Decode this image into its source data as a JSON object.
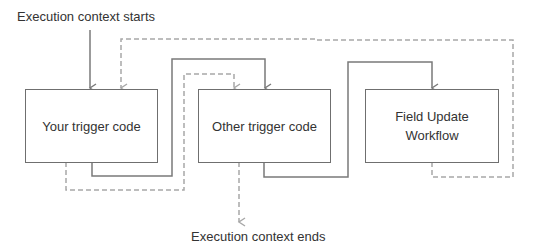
{
  "diagram": {
    "start_label": "Execution context starts",
    "end_label": "Execution context ends",
    "nodes": [
      {
        "id": "your-trigger",
        "label": "Your trigger code"
      },
      {
        "id": "other-trigger",
        "label": "Other trigger code"
      },
      {
        "id": "field-update",
        "line1": "Field Update",
        "line2": "Workflow"
      }
    ],
    "edges": [
      {
        "from": "start",
        "to": "your-trigger",
        "style": "solid"
      },
      {
        "from": "your-trigger",
        "to": "other-trigger",
        "style": "solid"
      },
      {
        "from": "other-trigger",
        "to": "field-update",
        "style": "solid"
      },
      {
        "from": "field-update",
        "to": "your-trigger",
        "style": "dashed"
      },
      {
        "from": "your-trigger",
        "to": "other-trigger",
        "style": "dashed"
      },
      {
        "from": "other-trigger",
        "to": "end",
        "style": "dashed"
      }
    ],
    "colors": {
      "solid_line": "#7a7a7a",
      "dashed_line": "#a8a8a8",
      "box_border": "#6f6f6f",
      "text": "#333333"
    }
  }
}
